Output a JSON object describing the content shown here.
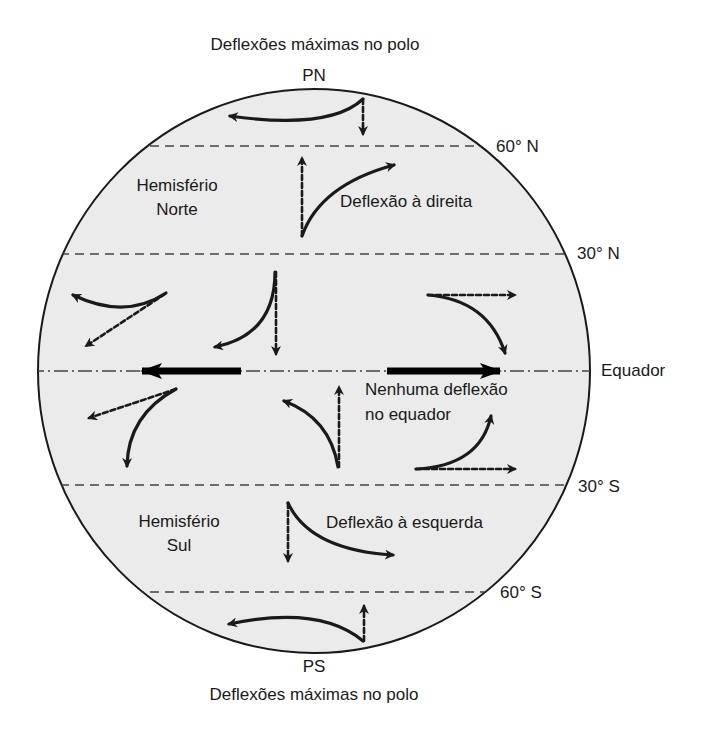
{
  "title_top": "Deflexões máximas no polo",
  "title_bottom": "Deflexões máximas no polo",
  "poles": {
    "north": "PN",
    "south": "PS"
  },
  "latitudes": {
    "n60": "60° N",
    "n30": "30° N",
    "equator": "Equador",
    "s30": "30° S",
    "s60": "60° S"
  },
  "hemispheres": {
    "north_line1": "Hemisfério",
    "north_line2": "Norte",
    "south_line1": "Hemisfério",
    "south_line2": "Sul"
  },
  "annotations": {
    "north_deflection": "Deflexão à direita",
    "south_deflection": "Deflexão à esquerda",
    "equator_line1": "Nenhuma deflexão",
    "equator_line2": "no equador"
  },
  "colors": {
    "globe_fill": "#ebebeb",
    "ink": "#1a1a1a",
    "dash": "#444444"
  },
  "legend_semantics": {
    "solid_curved_arrow": "deflected path",
    "dashed_straight_arrow": "intended path",
    "thick_arrow": "no deflection at equator"
  }
}
